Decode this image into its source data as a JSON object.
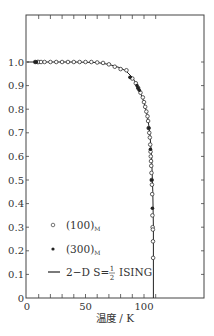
{
  "chart_data": {
    "type": "scatter",
    "title": "",
    "xlabel": "温度 / K",
    "ylabel": "",
    "xlim": [
      0,
      150
    ],
    "ylim": [
      0,
      1.2
    ],
    "x_ticks": [
      0,
      50,
      100
    ],
    "x_minor_step": 10,
    "y_ticks": [
      0,
      0.1,
      0.2,
      0.3,
      0.4,
      0.5,
      0.6,
      0.7,
      0.8,
      0.9,
      1.0
    ],
    "y_tick_labels": [
      "0",
      "0.1",
      "0.2",
      "0.3",
      "0.4",
      "0.5",
      "0.6",
      "0.7",
      "0.8",
      "0.9",
      "1.0"
    ],
    "grid": false,
    "legend_position": "lower-left",
    "critical_temperature": 108,
    "series": [
      {
        "name": "(100)",
        "subscript": "M",
        "marker": "open-circle",
        "x": [
          7,
          9,
          10,
          12,
          15,
          20,
          25,
          30,
          35,
          40,
          45,
          50,
          55,
          60,
          65,
          70,
          75,
          80,
          85,
          90,
          93,
          95,
          97,
          99,
          100,
          101,
          102,
          103,
          103.5,
          104,
          104.5,
          105,
          105.3,
          105.6,
          105.8,
          106,
          106.2,
          106.4,
          106.6,
          106.8,
          107,
          107.2,
          107.4,
          107.6,
          107.7,
          107.8
        ],
        "y": [
          1.0,
          1.0,
          1.0,
          1.0,
          1.0,
          1.0,
          1.0,
          1.0,
          1.0,
          1.0,
          1.0,
          1.0,
          1.0,
          0.998,
          0.996,
          0.99,
          0.98,
          0.97,
          0.965,
          0.93,
          0.91,
          0.89,
          0.87,
          0.85,
          0.83,
          0.81,
          0.79,
          0.77,
          0.75,
          0.72,
          0.7,
          0.68,
          0.65,
          0.62,
          0.6,
          0.58,
          0.56,
          0.53,
          0.5,
          0.48,
          0.44,
          0.35,
          0.3,
          0.29,
          0.24,
          0.17
        ]
      },
      {
        "name": "(300)",
        "subscript": "M",
        "marker": "filled-circle",
        "x": [
          7,
          8,
          88,
          94,
          95,
          96,
          104,
          105.5,
          106.5,
          107.2
        ],
        "y": [
          1.0,
          1.0,
          0.935,
          0.9,
          0.89,
          0.88,
          0.72,
          0.63,
          0.5,
          0.38
        ]
      },
      {
        "name": "2−D S=½ ISING",
        "marker": "line",
        "x": [
          0,
          20,
          40,
          60,
          70,
          80,
          85,
          90,
          95,
          100,
          103,
          105,
          106.5,
          107.5,
          108,
          108
        ],
        "y": [
          1.0,
          1.0,
          1.0,
          0.998,
          0.99,
          0.975,
          0.96,
          0.935,
          0.895,
          0.83,
          0.77,
          0.7,
          0.6,
          0.45,
          0.3,
          0.0
        ]
      }
    ]
  },
  "legend": {
    "items": [
      {
        "label": "(100)",
        "sub": "M",
        "marker": "open-circle"
      },
      {
        "label": "(300)",
        "sub": "M",
        "marker": "filled-circle"
      },
      {
        "label_prefix": "2−D S=",
        "frac_num": "1",
        "frac_den": "2",
        "label_suffix": "ISING",
        "marker": "line"
      }
    ]
  },
  "axes": {
    "xlabel": "温度 / K",
    "x_tick_labels": [
      "0",
      "50",
      "100"
    ],
    "y_tick_labels": [
      "0",
      "0.1",
      "0.2",
      "0.3",
      "0.4",
      "0.5",
      "0.6",
      "0.7",
      "0.8",
      "0.9",
      "1.0"
    ]
  },
  "colors": {
    "axis": "#444444",
    "marker": "#333333",
    "line": "#222222"
  }
}
